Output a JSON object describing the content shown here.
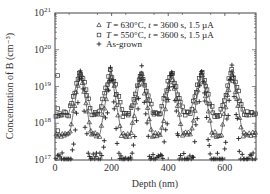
{
  "chart_data": {
    "type": "scatter",
    "title": "",
    "xlabel": "Depth (nm)",
    "ylabel": "Concentration of B (cm⁻³)",
    "xlim": [
      0,
      710
    ],
    "ylim_log10": [
      17,
      21
    ],
    "xticks": [
      0,
      200,
      400,
      600
    ],
    "yticks": [
      {
        "exp": 17,
        "label": "10",
        "sup": "17"
      },
      {
        "exp": 18,
        "label": "10",
        "sup": "18"
      },
      {
        "exp": 19,
        "label": "10",
        "sup": "19"
      },
      {
        "exp": 20,
        "label": "10",
        "sup": "20"
      },
      {
        "exp": 21,
        "label": "10",
        "sup": "21"
      }
    ],
    "yscale": "log",
    "grid": false,
    "legend_position": "upper right",
    "peak_depths_nm": [
      90,
      197,
      305,
      412,
      518,
      625
    ],
    "series": [
      {
        "name": "T = 630°C, t = 3600 s, 1.5 µA",
        "legend_parts": [
          "T",
          " = 630°C, ",
          "t",
          " = 3600 s, 1.5 µA"
        ],
        "marker": "triangle",
        "peak_log10": 19.45,
        "valley_log10": 17.7,
        "peak_width_nm": 38
      },
      {
        "name": "T = 550°C, t = 3600 s, 1.5 µA",
        "legend_parts": [
          "T",
          " = 550°C, ",
          "t",
          " = 3600 s, 1.5 µA"
        ],
        "marker": "square",
        "peak_log10": 19.45,
        "valley_log10": 18.25,
        "peak_width_nm": 42
      },
      {
        "name": "As-grown",
        "legend_parts": [
          "",
          "As-grown",
          "",
          ""
        ],
        "marker": "plus",
        "peak_log10": 19.5,
        "valley_log10": 17.0,
        "peak_width_nm": 30
      }
    ],
    "annotations": [
      {
        "type": "outlier_squares_near_surface",
        "points": [
          [
            2,
            19.3
          ],
          [
            3,
            18.4
          ],
          [
            3,
            17.8
          ]
        ]
      }
    ]
  }
}
